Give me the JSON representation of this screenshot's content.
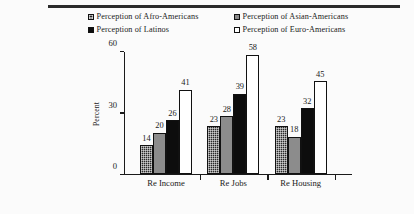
{
  "figure": {
    "background": "#fbfbfb",
    "rule_color": "#2b2b2b"
  },
  "legend": {
    "position": "top",
    "items": [
      {
        "label": "Perception of Afro-Americans",
        "swatch": "stipple",
        "color": "#2a2a2a"
      },
      {
        "label": "Perception of Latinos",
        "swatch": "black",
        "color": "#0d0d0d"
      },
      {
        "label": "Perception of Asian-Americans",
        "swatch": "gray",
        "color": "#8c8c8c"
      },
      {
        "label": "Perception of Euro-Americans",
        "swatch": "white",
        "color": "#ffffff"
      }
    ]
  },
  "axes": {
    "y_label": "Percent",
    "y_ticks": [
      "0",
      "30",
      "60"
    ],
    "x_labels": [
      "Re Income",
      "Re Jobs",
      "Re Housing"
    ]
  },
  "chart_data": {
    "type": "bar",
    "title": "",
    "xlabel": "",
    "ylabel": "Percent",
    "ylim": [
      0,
      60
    ],
    "yticks": [
      0,
      30,
      60
    ],
    "grid": false,
    "legend_position": "top",
    "categories": [
      "Re Income",
      "Re Jobs",
      "Re Housing"
    ],
    "series": [
      {
        "name": "Perception of Afro-Americans",
        "pattern": "stipple",
        "color": "#2a2a2a",
        "values": [
          14,
          23,
          23
        ]
      },
      {
        "name": "Perception of Asian-Americans",
        "pattern": "gray",
        "color": "#8c8c8c",
        "values": [
          20,
          28,
          18
        ]
      },
      {
        "name": "Perception of Latinos",
        "pattern": "black",
        "color": "#0d0d0d",
        "values": [
          26,
          39,
          32
        ]
      },
      {
        "name": "Perception of Euro-Americans",
        "pattern": "white",
        "color": "#ffffff",
        "values": [
          41,
          58,
          45
        ]
      }
    ],
    "bar_order": [
      "Perception of Afro-Americans",
      "Perception of Asian-Americans",
      "Perception of Latinos",
      "Perception of Euro-Americans"
    ],
    "data_labels": true
  }
}
